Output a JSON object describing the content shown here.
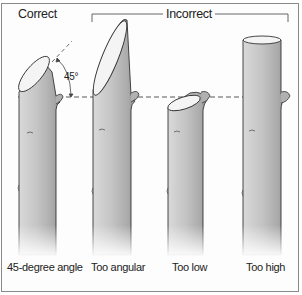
{
  "headings": {
    "correct": "Correct",
    "incorrect": "Incorrect"
  },
  "angle_annotation": "45°",
  "panels": [
    {
      "label": "45-degree angle",
      "category": "correct"
    },
    {
      "label": "Too angular",
      "category": "incorrect"
    },
    {
      "label": "Too low",
      "category": "incorrect"
    },
    {
      "label": "Too high",
      "category": "incorrect"
    }
  ],
  "colors": {
    "border": "#8a8a8a",
    "stem_fill": "#c9c9c9",
    "stem_shade": "#a8a8a8",
    "cut_face": "#f4f4f4",
    "outline": "#333333",
    "guide_dash": "#444444"
  }
}
